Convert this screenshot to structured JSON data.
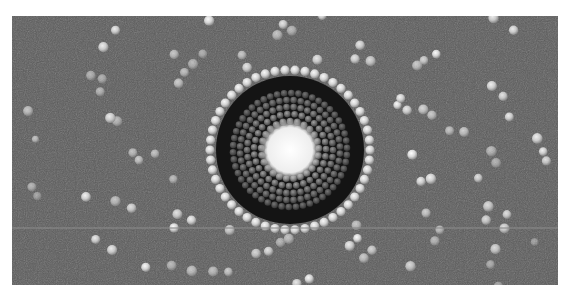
{
  "figure": {
    "colors": {
      "background": "#5a5a5a",
      "core": "#f2f2f2",
      "inner_rings": "#8c8c8c",
      "dark_ring": "#141414",
      "bright_dots": "#e6e6e6",
      "scan_line": "#8a8a8a"
    },
    "center": {
      "x": 278,
      "y": 134
    },
    "core_radius": 26,
    "inner_ring_radius": 62,
    "dark_ring_outer_radius": 74,
    "bright_ring_radius": 80,
    "scan_line_y": 211
  },
  "caption": {
    "fragments": [
      "",
      ""
    ]
  }
}
